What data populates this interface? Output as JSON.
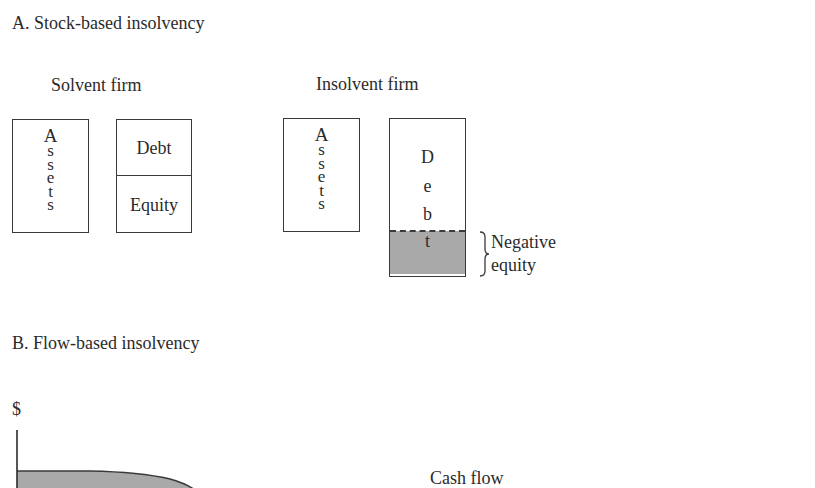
{
  "panel_a": {
    "title": "A.  Stock-based insolvency",
    "solvent": {
      "label": "Solvent firm",
      "assets_letters": [
        "A",
        "s",
        "s",
        "e",
        "t",
        "s"
      ],
      "debt_label": "Debt",
      "equity_label": "Equity"
    },
    "insolvent": {
      "label": "Insolvent firm",
      "assets_letters": [
        "A",
        "s",
        "s",
        "e",
        "t",
        "s"
      ],
      "debt_letters": [
        "D",
        "e",
        "b",
        "t"
      ],
      "negative_equity_line1": "Negative",
      "negative_equity_line2": "equity"
    }
  },
  "panel_b": {
    "title": "B.  Flow-based insolvency",
    "y_axis_label": "$",
    "curve_label": "Cash flow"
  },
  "colors": {
    "ink": "#2b2b2b",
    "box_border": "#3a3a3a",
    "shade": "#a9a9a9",
    "background": "#ffffff"
  }
}
